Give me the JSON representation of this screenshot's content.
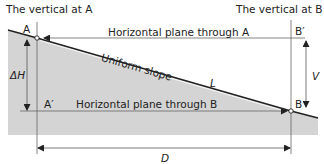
{
  "diagram": {
    "title_vertical_a": "The vertical at A",
    "title_vertical_b": "The vertical at B",
    "point_a": "A",
    "point_b": "B",
    "point_a_prime": "A′",
    "point_b_prime": "B′",
    "plane_a": "Horizontal plane through A",
    "plane_b": "Horizontal plane through B",
    "slope_label": "Uniform slope",
    "slope_length": "L",
    "delta_h": "ΔH",
    "vertical_v": "V",
    "distance_d": "D",
    "colors": {
      "ground_fill": "#d4d4d4",
      "line": "#333333",
      "thin_line": "#666666"
    }
  }
}
